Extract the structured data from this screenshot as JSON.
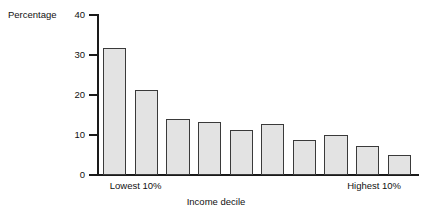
{
  "chart_data": {
    "type": "bar",
    "title": "",
    "xlabel": "Income decile",
    "ylabel": "Percentage",
    "ylim": [
      0,
      40
    ],
    "yticks": [
      0,
      10,
      20,
      30,
      40
    ],
    "ytick_labels": [
      "0",
      "10",
      "20",
      "30",
      "40"
    ],
    "grid": false,
    "legend": null,
    "categories": [
      "1",
      "2",
      "3",
      "4",
      "5",
      "6",
      "7",
      "8",
      "9",
      "10"
    ],
    "values": [
      31.7,
      21.2,
      14.0,
      13.2,
      11.2,
      12.7,
      8.7,
      9.9,
      7.3,
      4.9
    ],
    "category_annotations": [
      {
        "text": "Lowest 10%",
        "at_category": "1"
      },
      {
        "text": "Highest 10%",
        "at_category": "10"
      }
    ],
    "bar_fill_color": "#e3e3e3",
    "bar_edge_color": "#3a3a3a",
    "axis_color": "#1a1a1a"
  },
  "axis_labels": {
    "y_title": "Percentage",
    "x_title": "Income decile",
    "x_low": "Lowest 10%",
    "x_high": "Highest 10%"
  }
}
